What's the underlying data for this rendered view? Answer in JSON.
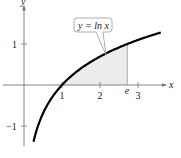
{
  "chart_data": {
    "type": "line",
    "title": "",
    "function_label": "y = ln x",
    "xlabel": "x",
    "ylabel": "y",
    "xlim": [
      -0.6,
      3.6
    ],
    "ylim": [
      -1.6,
      1.9
    ],
    "x_ticks": [
      {
        "value": 1,
        "label": "1"
      },
      {
        "value": 2,
        "label": "2"
      },
      {
        "value": 2.718,
        "label": "e"
      },
      {
        "value": 3,
        "label": "3"
      }
    ],
    "y_ticks": [
      {
        "value": 1,
        "label": "1"
      },
      {
        "value": -1,
        "label": "−1"
      }
    ],
    "series": [
      {
        "name": "y = ln x",
        "x_range": [
          0.25,
          3.6
        ],
        "color": "#000000"
      }
    ],
    "shaded_region": {
      "x_from": 1,
      "x_to": 2.718,
      "under": "y = ln x",
      "color": "#eeeeee"
    },
    "grid": false,
    "legend": "none"
  }
}
